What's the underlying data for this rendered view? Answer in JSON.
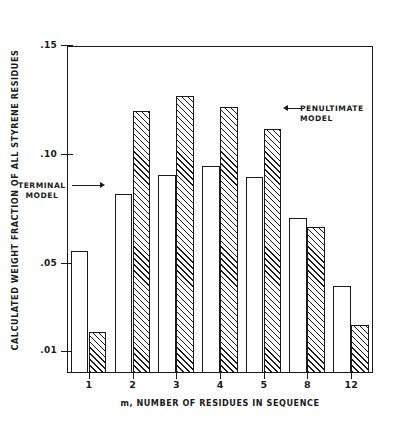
{
  "chart_data": {
    "type": "bar",
    "title": "",
    "xlabel": "m, NUMBER OF RESIDUES IN SEQUENCE",
    "ylabel": "CALCULATED WEIGHT FRACTION OF ALL STYRENE RESIDUES",
    "categories": [
      "1",
      "2",
      "3",
      "4",
      "5",
      "8",
      "12"
    ],
    "ylim": [
      0.0,
      0.15
    ],
    "ytick_labels": [
      ".15",
      ".10",
      ".05",
      ".01"
    ],
    "ytick_values": [
      0.15,
      0.1,
      0.05,
      0.01
    ],
    "grid": false,
    "legend_position": "in-plot-annotations",
    "series": [
      {
        "name": "TERMINAL MODEL",
        "style": "open",
        "values": [
          0.056,
          0.082,
          0.091,
          0.095,
          0.09,
          0.071,
          0.04
        ]
      },
      {
        "name": "PENULTIMATE MODEL",
        "style": "hatched",
        "values": [
          0.019,
          0.12,
          0.127,
          0.122,
          0.112,
          0.067,
          0.022
        ]
      }
    ],
    "annotations": [
      {
        "id": "terminal",
        "line1": "TERMINAL",
        "line2": "MODEL",
        "arrow": "right"
      },
      {
        "id": "penultimate",
        "line1": "PENULTIMATE",
        "line2": "MODEL",
        "arrow": "left"
      }
    ],
    "colors": {
      "axis": "#1a1a1a",
      "open_bar_fill": "#ffffff",
      "hatch_line": "#1a1a1a",
      "background": "#ffffff"
    }
  }
}
